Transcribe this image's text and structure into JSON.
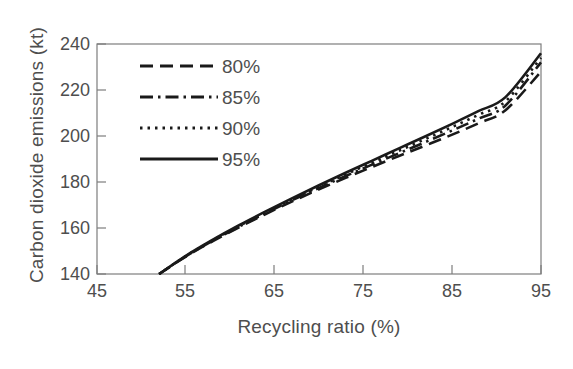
{
  "chart_data": {
    "type": "line",
    "title": "",
    "xlabel": "Recycling ratio (%)",
    "ylabel": "Carbon dioxide emissions (kt)",
    "xlim": [
      45,
      95
    ],
    "ylim": [
      140,
      240
    ],
    "xticks": [
      45,
      55,
      65,
      75,
      85,
      95
    ],
    "xtick_labels": [
      "45",
      "55",
      "65",
      "75",
      "85",
      "95"
    ],
    "yticks": [
      140,
      160,
      180,
      200,
      220,
      240
    ],
    "ytick_labels": [
      "140",
      "160",
      "180",
      "200",
      "220",
      "240"
    ],
    "grid": false,
    "legend_position": "upper-left-inside",
    "x": [
      52,
      55,
      58,
      61,
      64,
      67,
      70,
      73,
      76,
      79,
      82,
      85,
      88,
      91,
      95
    ],
    "series": [
      {
        "name": "80%",
        "style": "dashed",
        "color": "#1a1a1a",
        "values": [
          140.0,
          147.6,
          154.2,
          160.3,
          166.1,
          171.6,
          176.8,
          181.8,
          186.6,
          191.3,
          195.9,
          200.6,
          205.6,
          211.2,
          228.0
        ]
      },
      {
        "name": "85%",
        "style": "dash-dot",
        "color": "#1a1a1a",
        "values": [
          140.0,
          147.7,
          154.4,
          160.6,
          166.5,
          172.1,
          177.4,
          182.6,
          187.6,
          192.5,
          197.4,
          202.4,
          207.6,
          213.3,
          232.0
        ]
      },
      {
        "name": "90%",
        "style": "dotted",
        "color": "#1a1a1a",
        "values": [
          140.0,
          147.8,
          154.6,
          160.9,
          166.9,
          172.6,
          178.0,
          183.3,
          188.5,
          193.6,
          198.7,
          203.9,
          209.3,
          215.1,
          234.0
        ]
      },
      {
        "name": "95%",
        "style": "solid",
        "color": "#1a1a1a",
        "values": [
          140.0,
          147.9,
          154.8,
          161.2,
          167.2,
          173.0,
          178.6,
          184.0,
          189.3,
          194.6,
          199.9,
          205.3,
          210.9,
          216.9,
          236.0
        ]
      }
    ]
  },
  "legend": {
    "items": [
      {
        "label": "80%"
      },
      {
        "label": "85%"
      },
      {
        "label": "90%"
      },
      {
        "label": "95%"
      }
    ]
  },
  "axes": {
    "frame_color": "#7d7d7d"
  }
}
